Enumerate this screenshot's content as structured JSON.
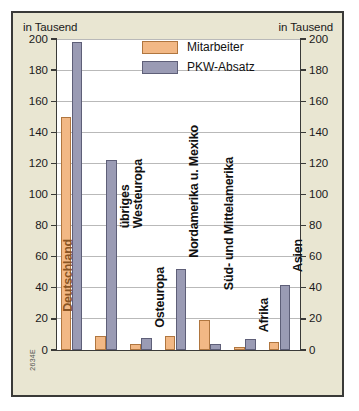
{
  "axis_unit_left": "in Tausend",
  "axis_unit_right": "in Tausend",
  "source_code": "2634E",
  "legend": {
    "items": [
      {
        "label": "Mitarbeiter",
        "color": "#f2b885",
        "key": "employees"
      },
      {
        "label": "PKW-Absatz",
        "color": "#9a9bb4",
        "key": "car_sales"
      }
    ]
  },
  "chart_data": {
    "type": "bar",
    "title": "",
    "subtitle": "",
    "xlabel": "",
    "ylabel": "in Tausend",
    "ylabel_right": "in Tausend",
    "ylim": [
      0,
      200
    ],
    "ytick_step": 20,
    "yticks": [
      0,
      20,
      40,
      60,
      80,
      100,
      120,
      140,
      160,
      180,
      200
    ],
    "ytick_labels": [
      "0",
      "20",
      "40",
      "60",
      "80",
      "100",
      "120",
      "140",
      "160",
      "180",
      "200"
    ],
    "ytick_labels_right": [
      "0",
      "20",
      "40",
      "60",
      "80",
      "100",
      "120",
      "140",
      "160",
      "180",
      "200"
    ],
    "grid": true,
    "legend_position": "top-right",
    "categories": [
      "Deutschland",
      "übriges\nWesteuropa",
      "Osteuropa",
      "Nordamerika u. Mexiko",
      "Süd- und Mittelamerika",
      "Afrika",
      "Asien"
    ],
    "series": [
      {
        "name": "Mitarbeiter",
        "color": "#f2b885",
        "values": [
          150,
          9,
          4,
          9,
          19,
          2,
          5
        ]
      },
      {
        "name": "PKW-Absatz",
        "color": "#9a9bb4",
        "values": [
          198,
          122,
          8,
          52,
          4,
          7,
          42
        ]
      }
    ]
  }
}
